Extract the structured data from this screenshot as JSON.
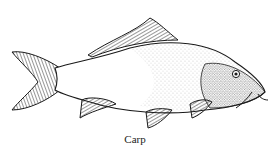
{
  "illustration": {
    "subject": "carp-fish-drawing",
    "style": "pen-and-ink stipple and hatching",
    "caption": "Carp",
    "colors": {
      "ink": "#1a1a1a",
      "background": "#ffffff"
    }
  }
}
